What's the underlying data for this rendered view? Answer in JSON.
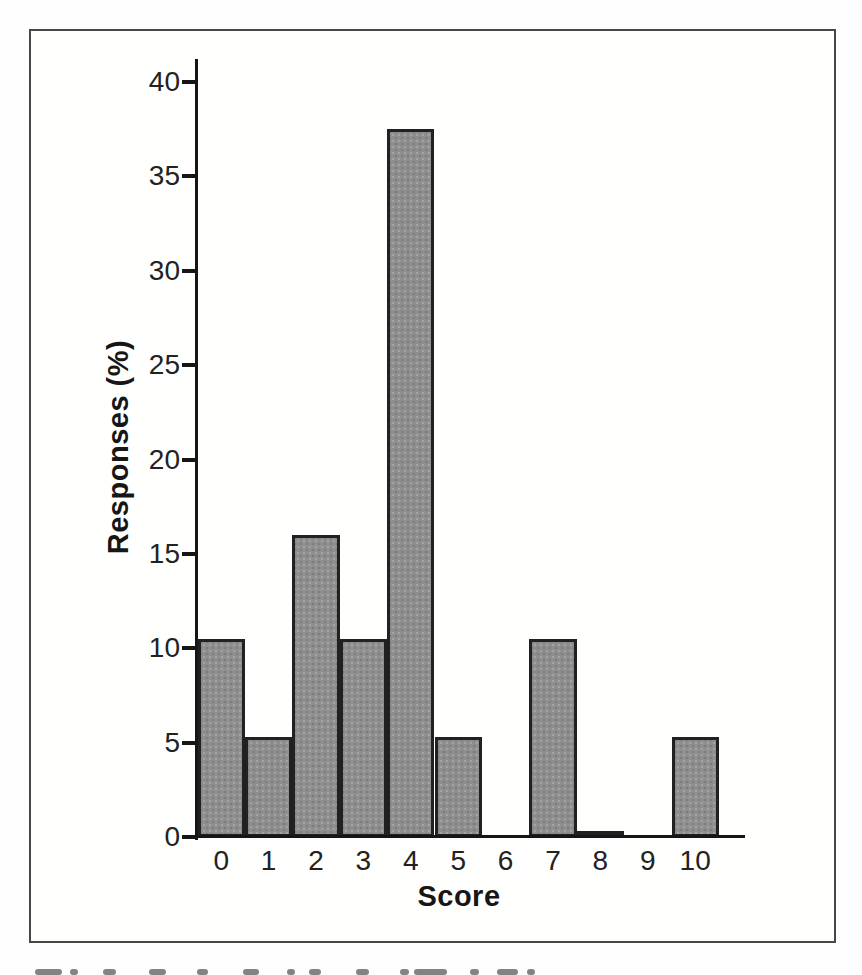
{
  "chart_data": {
    "type": "bar",
    "title": "",
    "xlabel": "Score",
    "ylabel": "Responses (%)",
    "categories": [
      "0",
      "1",
      "2",
      "3",
      "4",
      "5",
      "6",
      "7",
      "8",
      "9",
      "10"
    ],
    "values": [
      10.5,
      5.3,
      16,
      10.5,
      37.5,
      5.3,
      0,
      10.5,
      0.3,
      0,
      5.3
    ],
    "ylim": [
      0,
      40
    ],
    "ytick_step": 5,
    "yticks": [
      0,
      5,
      10,
      15,
      20,
      25,
      30,
      35,
      40
    ],
    "grid": false,
    "legend": "none",
    "style": {
      "bar_fill": "#8e8e8e",
      "bar_speckle_light": "#a4a4a4",
      "bar_speckle_dark": "#7c7c7c",
      "bar_border": "#212121",
      "axis_color": "#161616",
      "frame_border": "#474747",
      "background": "#fffffe"
    }
  }
}
